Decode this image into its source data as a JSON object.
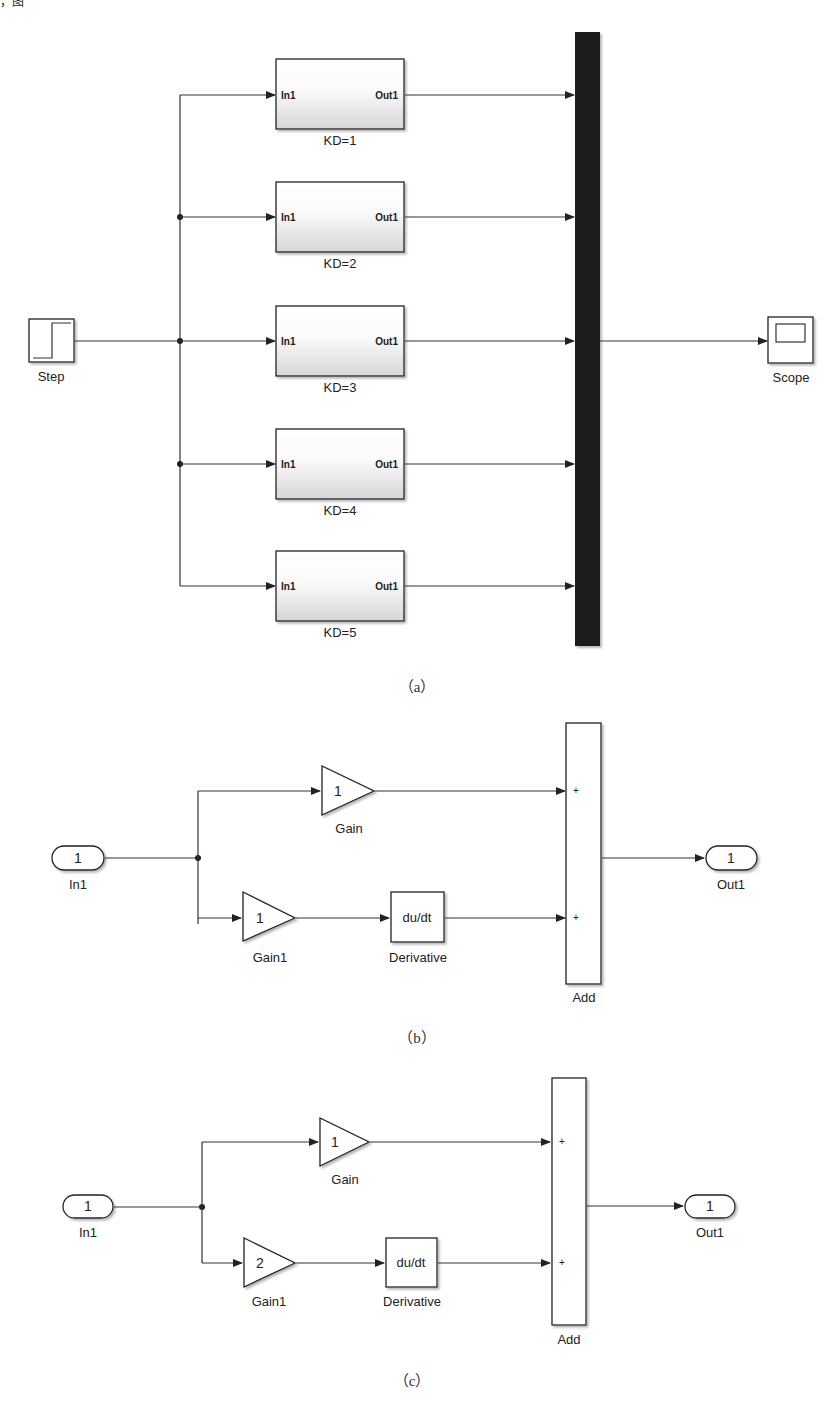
{
  "top_fragment": "，图 ",
  "diagram_a": {
    "caption": "（a）",
    "step": {
      "label": "Step"
    },
    "scope": {
      "label": "Scope"
    },
    "subsystems": [
      {
        "label": "KD=1",
        "in": "In1",
        "out": "Out1"
      },
      {
        "label": "KD=2",
        "in": "In1",
        "out": "Out1"
      },
      {
        "label": "KD=3",
        "in": "In1",
        "out": "Out1"
      },
      {
        "label": "KD=4",
        "in": "In1",
        "out": "Out1"
      },
      {
        "label": "KD=5",
        "in": "In1",
        "out": "Out1"
      }
    ],
    "mux": {
      "label": "Mux"
    }
  },
  "diagram_b": {
    "caption": "（b）",
    "in_port": {
      "value": "1",
      "label": "In1"
    },
    "gain": {
      "value": "1",
      "label": "Gain"
    },
    "gain1": {
      "value": "1",
      "label": "Gain1"
    },
    "derivative": {
      "value": "du/dt",
      "label": "Derivative"
    },
    "add": {
      "label": "Add",
      "sign1": "+",
      "sign2": "+"
    },
    "out_port": {
      "value": "1",
      "label": "Out1"
    }
  },
  "diagram_c": {
    "caption": "（c）",
    "in_port": {
      "value": "1",
      "label": "In1"
    },
    "gain": {
      "value": "1",
      "label": "Gain"
    },
    "gain1": {
      "value": "2",
      "label": "Gain1"
    },
    "derivative": {
      "value": "du/dt",
      "label": "Derivative"
    },
    "add": {
      "label": "Add",
      "sign1": "+",
      "sign2": "+"
    },
    "out_port": {
      "value": "1",
      "label": "Out1"
    }
  }
}
